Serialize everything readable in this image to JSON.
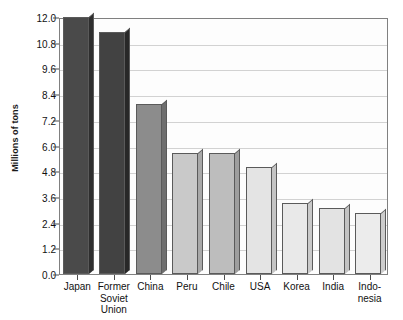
{
  "chart_data": {
    "type": "bar",
    "title": "",
    "xlabel": "",
    "ylabel": "Millions of tons",
    "categories": [
      "Japan",
      "Former\nSoviet\nUnion",
      "China",
      "Peru",
      "Chile",
      "USA",
      "Korea",
      "India",
      "Indo-\nnesia"
    ],
    "values": [
      12.0,
      11.3,
      7.95,
      5.65,
      5.65,
      5.0,
      3.3,
      3.1,
      2.85
    ],
    "ylim": [
      0.0,
      12.0
    ],
    "ytick_labels": [
      "0.0",
      "1.2",
      "2.4",
      "3.6",
      "4.8",
      "6.0",
      "7.2",
      "8.4",
      "9.6",
      "10.8",
      "12.0"
    ],
    "ytick_values": [
      0.0,
      1.2,
      2.4,
      3.6,
      4.8,
      6.0,
      7.2,
      8.4,
      9.6,
      10.8,
      12.0
    ],
    "grid": true,
    "legend": "none",
    "bar_colors": [
      "#4a4a4a",
      "#424242",
      "#8c8c8c",
      "#c9c9c9",
      "#bdbdbd",
      "#e4e4e4",
      "#e9e9e9",
      "#e3e3e3",
      "#ececec"
    ],
    "bar_side_colors": [
      "#2e2e2e",
      "#282828",
      "#6e6e6e",
      "#a8a8a8",
      "#9e9e9e",
      "#c4c4c4",
      "#c9c9c9",
      "#c3c3c3",
      "#cccccc"
    ],
    "axis_color": "#808080",
    "gridline_color": "#d2d2d2",
    "text_color": "#111111"
  }
}
